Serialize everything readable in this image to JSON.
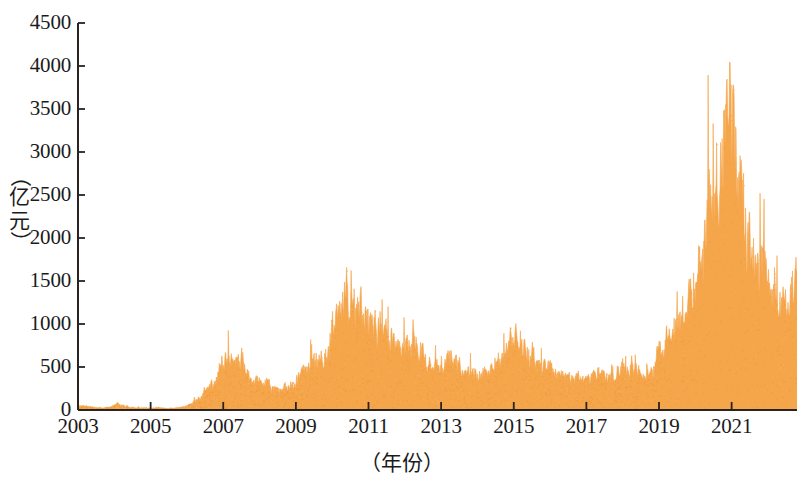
{
  "chart_data": {
    "type": "area",
    "title": "",
    "subtitle": "",
    "xlabel": "（年份）",
    "ylabel": "（亿元）",
    "ylim": [
      0,
      4500
    ],
    "xlim": [
      2003,
      2022.8
    ],
    "yticks": [
      0,
      500,
      1000,
      1500,
      2000,
      2500,
      3000,
      3500,
      4000,
      4500
    ],
    "ytick_labels": [
      "0",
      "500",
      "1000",
      "1500",
      "2000",
      "2500",
      "3000",
      "3500",
      "4000",
      "4500"
    ],
    "xticks": [
      2003,
      2005,
      2007,
      2009,
      2011,
      2013,
      2015,
      2017,
      2019,
      2021
    ],
    "xtick_labels": [
      "2003",
      "2005",
      "2007",
      "2009",
      "2011",
      "2013",
      "2015",
      "2017",
      "2019",
      "2021"
    ],
    "grid": false,
    "legend": false,
    "legend_position": "none",
    "fill_color": "#F5A54A",
    "axis_color": "#2a2320",
    "series": [
      {
        "name": "成交额",
        "x": [
          2003.0,
          2003.1,
          2003.2,
          2003.3,
          2003.4,
          2003.5,
          2003.6,
          2003.7,
          2003.8,
          2003.9,
          2004.0,
          2004.1,
          2004.2,
          2004.3,
          2004.4,
          2004.5,
          2004.6,
          2004.7,
          2004.8,
          2004.9,
          2005.0,
          2005.1,
          2005.2,
          2005.3,
          2005.4,
          2005.5,
          2005.6,
          2005.7,
          2005.8,
          2005.9,
          2006.0,
          2006.1,
          2006.2,
          2006.3,
          2006.4,
          2006.5,
          2006.6,
          2006.7,
          2006.8,
          2006.9,
          2007.0,
          2007.1,
          2007.2,
          2007.3,
          2007.4,
          2007.5,
          2007.6,
          2007.7,
          2007.8,
          2007.9,
          2008.0,
          2008.2,
          2008.4,
          2008.6,
          2008.8,
          2009.0,
          2009.2,
          2009.4,
          2009.6,
          2009.8,
          2010.0,
          2010.2,
          2010.4,
          2010.6,
          2010.8,
          2011.0,
          2011.2,
          2011.4,
          2011.6,
          2011.8,
          2012.0,
          2012.2,
          2012.4,
          2012.6,
          2012.8,
          2013.0,
          2013.2,
          2013.4,
          2013.6,
          2013.8,
          2014.0,
          2014.2,
          2014.4,
          2014.6,
          2014.8,
          2015.0,
          2015.2,
          2015.4,
          2015.6,
          2015.8,
          2016.0,
          2016.2,
          2016.4,
          2016.6,
          2016.8,
          2017.0,
          2017.2,
          2017.4,
          2017.6,
          2017.8,
          2018.0,
          2018.2,
          2018.4,
          2018.6,
          2018.8,
          2019.0,
          2019.2,
          2019.4,
          2019.6,
          2019.8,
          2020.0,
          2020.2,
          2020.4,
          2020.6,
          2020.8,
          2021.0,
          2021.2,
          2021.4,
          2021.6,
          2021.8,
          2022.0,
          2022.2,
          2022.4,
          2022.6,
          2022.8
        ],
        "values": [
          30,
          45,
          50,
          40,
          35,
          30,
          28,
          25,
          30,
          35,
          55,
          70,
          60,
          45,
          38,
          32,
          30,
          28,
          26,
          24,
          25,
          28,
          30,
          26,
          22,
          20,
          22,
          25,
          30,
          38,
          50,
          70,
          95,
          130,
          175,
          230,
          270,
          300,
          340,
          420,
          560,
          640,
          600,
          520,
          560,
          640,
          520,
          430,
          390,
          350,
          330,
          300,
          250,
          230,
          260,
          330,
          430,
          520,
          560,
          620,
          900,
          1150,
          1400,
          1280,
          1150,
          1050,
          900,
          1000,
          780,
          650,
          700,
          850,
          700,
          560,
          480,
          500,
          600,
          560,
          470,
          420,
          430,
          450,
          480,
          560,
          700,
          900,
          760,
          620,
          560,
          520,
          480,
          450,
          420,
          400,
          380,
          360,
          400,
          430,
          400,
          420,
          470,
          520,
          480,
          440,
          470,
          700,
          950,
          880,
          1050,
          1180,
          1500,
          1900,
          2300,
          2700,
          3100,
          4000,
          2400,
          2100,
          1900,
          1700,
          1500,
          1350,
          1250,
          1400,
          1450
        ]
      }
    ],
    "peak_annotation": {
      "year": 2021.0,
      "value": 4000
    }
  },
  "axis": {
    "y_axis_name": "y-axis",
    "x_axis_name": "x-axis"
  }
}
